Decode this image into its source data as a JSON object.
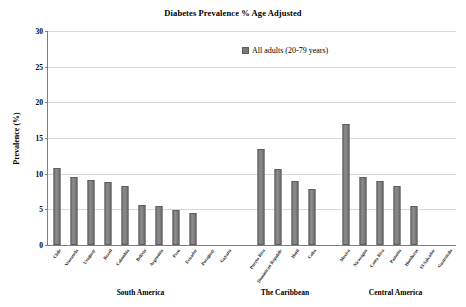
{
  "chart_data": {
    "type": "bar",
    "title": "Diabetes Prevalence % Age Adjusted",
    "xlabel": "",
    "ylabel": "Prevalence (%)",
    "ylim": [
      0,
      30
    ],
    "ytick_step": 5,
    "yticks": [
      "0",
      "5",
      "10",
      "15",
      "20",
      "25",
      "30"
    ],
    "grid": true,
    "legend_position": "top-right",
    "series": [
      {
        "name": "All adults (20-79 years)",
        "color": "#7a7a7a"
      }
    ],
    "groups": [
      {
        "label": "South America",
        "categories": [
          "Chile",
          "Venezuela",
          "Uruguay",
          "Brazil",
          "Colombia",
          "Bolivia",
          "Argentina",
          "Peru",
          "Ecuador",
          "Paraguay",
          "Guyana"
        ],
        "values": [
          10.8,
          9.6,
          9.1,
          8.9,
          8.3,
          5.6,
          5.4,
          4.9,
          4.5,
          0,
          0
        ]
      },
      {
        "label": "The Caribbean",
        "categories": [
          "Puerto Rico",
          "Dominican Republic",
          "Haiti",
          "Cuba"
        ],
        "values": [
          13.5,
          10.6,
          9.0,
          7.8
        ]
      },
      {
        "label": "Central America",
        "categories": [
          "Mexico",
          "Nicaragua",
          "Costa Rica",
          "Panama",
          "Honduras",
          "El Salvador",
          "Guatemala"
        ],
        "values": [
          17.0,
          9.6,
          9.0,
          8.3,
          5.4,
          0,
          0
        ]
      }
    ]
  }
}
